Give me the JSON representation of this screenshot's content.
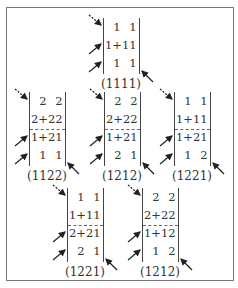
{
  "diagram": {
    "frame_color": "#777777",
    "matrices": [
      {
        "id": "m1111",
        "label": "(1111)",
        "x": 103,
        "y": 18,
        "rows": 3,
        "dashed_after_row": null,
        "cells": [
          [
            "1",
            "1"
          ],
          [
            "1+1",
            "1"
          ],
          [
            "1",
            "1"
          ]
        ]
      },
      {
        "id": "m1122",
        "label": "(1122)",
        "x": 29,
        "y": 92,
        "rows": 4,
        "dashed_after_row": 2,
        "cells": [
          [
            "2",
            "2"
          ],
          [
            "2+2",
            "2"
          ],
          [
            "1+2",
            "1"
          ],
          [
            "1",
            "1"
          ]
        ]
      },
      {
        "id": "m1212a",
        "label": "(1212)",
        "x": 104,
        "y": 92,
        "rows": 4,
        "dashed_after_row": 2,
        "cells": [
          [
            "2",
            "2"
          ],
          [
            "2+2",
            "2"
          ],
          [
            "1+2",
            "1"
          ],
          [
            "2",
            "1"
          ]
        ]
      },
      {
        "id": "m1221a",
        "label": "(1221)",
        "x": 174,
        "y": 92,
        "rows": 4,
        "dashed_after_row": 2,
        "cells": [
          [
            "1",
            "1"
          ],
          [
            "1+1",
            "1"
          ],
          [
            "1+2",
            "1"
          ],
          [
            "1",
            "2"
          ]
        ]
      },
      {
        "id": "m1221b",
        "label": "(1221)",
        "x": 67,
        "y": 188,
        "rows": 4,
        "dashed_after_row": 2,
        "cells": [
          [
            "1",
            "1"
          ],
          [
            "1+1",
            "1"
          ],
          [
            "2+2",
            "1"
          ],
          [
            "2",
            "1"
          ]
        ]
      },
      {
        "id": "m1212b",
        "label": "(1212)",
        "x": 142,
        "y": 188,
        "rows": 4,
        "dashed_after_row": 2,
        "cells": [
          [
            "2",
            "2"
          ],
          [
            "2+2",
            "2"
          ],
          [
            "1+1",
            "2"
          ],
          [
            "1",
            "2"
          ]
        ]
      }
    ]
  }
}
